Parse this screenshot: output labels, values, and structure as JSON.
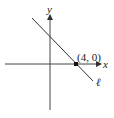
{
  "diagram": {
    "type": "coordinate-plane",
    "axes": {
      "x_label": "x",
      "y_label": "y"
    },
    "line": {
      "label": "ℓ",
      "slope_sign": "negative"
    },
    "point": {
      "label": "(4, 0)",
      "x": 4,
      "y": 0
    },
    "colors": {
      "stroke": "#333333",
      "background": "#ffffff"
    }
  }
}
